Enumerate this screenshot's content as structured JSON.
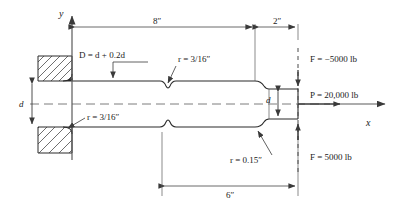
{
  "figure": {
    "type": "engineering-diagram",
    "colors": {
      "line": "#3a3a3a",
      "outline": "#2b2b2b",
      "hatch": "#4a4a4a",
      "centerline": "#6e6e6e",
      "background": "#ffffff"
    }
  },
  "axes": {
    "y_label": "y",
    "x_label": "x",
    "origin_note": "origin at wall face / shaft centerline"
  },
  "dimensions": [
    {
      "id": "dim-8in",
      "label": "8″",
      "value": 8,
      "unit": "in",
      "placement": "top",
      "from": "wall face",
      "to": "shoulder start"
    },
    {
      "id": "dim-2in",
      "label": "2″",
      "value": 2,
      "unit": "in",
      "placement": "top",
      "from": "shoulder start",
      "to": "free end"
    },
    {
      "id": "dim-6in",
      "label": "6″",
      "value": 6,
      "unit": "in",
      "placement": "bottom",
      "from": "groove",
      "to": "free end"
    }
  ],
  "diameters": [
    {
      "id": "dia-d-left",
      "label": "d",
      "placement": "left",
      "note": "shaft diameter at wall"
    },
    {
      "id": "dia-d-right",
      "label": "d",
      "placement": "right",
      "note": "reduced shaft diameter at free end"
    }
  ],
  "annotations": [
    {
      "id": "ann-D",
      "text": "D = d + 0.2d",
      "points_to": "large shaft diameter",
      "position": "upper-left"
    },
    {
      "id": "ann-r-groove",
      "text": "r = 3/16″",
      "points_to": "groove root radius",
      "position": "upper-middle"
    },
    {
      "id": "ann-r-wall",
      "text": "r = 3/16″",
      "points_to": "wall fillet radius",
      "position": "lower-left"
    },
    {
      "id": "ann-r-step",
      "text": "r = 0.15″",
      "points_to": "step fillet radius",
      "position": "lower-right"
    }
  ],
  "loads": [
    {
      "id": "load-F-top",
      "text": "F = −5000 lb",
      "symbol": "F",
      "value": -5000,
      "unit": "lb",
      "direction": "downward",
      "position": "top-right"
    },
    {
      "id": "load-P",
      "text": "P = 20,000 lb",
      "symbol": "P",
      "value": 20000,
      "unit": "lb",
      "direction": "axial +x",
      "position": "middle-right"
    },
    {
      "id": "load-F-bottom",
      "text": "F = 5000 lb",
      "symbol": "F",
      "value": 5000,
      "unit": "lb",
      "direction": "upward",
      "position": "bottom-right"
    }
  ]
}
